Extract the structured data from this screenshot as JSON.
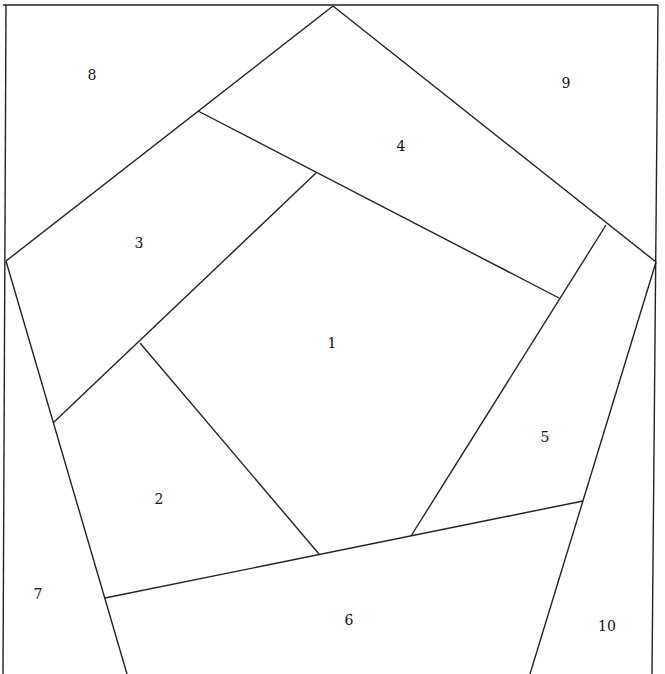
{
  "diagram": {
    "type": "pentagon-patchwork",
    "stroke_color": "#222222",
    "background": "#ffffff",
    "regions": [
      {
        "id": "8",
        "x": 92,
        "y": 75
      },
      {
        "id": "9",
        "x": 566,
        "y": 83
      },
      {
        "id": "4",
        "x": 401,
        "y": 146
      },
      {
        "id": "3",
        "x": 139,
        "y": 243
      },
      {
        "id": "1",
        "x": 332,
        "y": 343
      },
      {
        "id": "5",
        "x": 545,
        "y": 437
      },
      {
        "id": "2",
        "x": 159,
        "y": 499
      },
      {
        "id": "7",
        "x": 38,
        "y": 594
      },
      {
        "id": "6",
        "x": 349,
        "y": 620
      },
      {
        "id": "10",
        "x": 607,
        "y": 626
      }
    ],
    "lines": [
      [
        3,
        5,
        658,
        5
      ],
      [
        6,
        5,
        3,
        674
      ],
      [
        658,
        5,
        652,
        674
      ],
      [
        333,
        6,
        6,
        261
      ],
      [
        6,
        261,
        127,
        674
      ],
      [
        333,
        6,
        656,
        262
      ],
      [
        656,
        262,
        530,
        674
      ],
      [
        198,
        111,
        559,
        298
      ],
      [
        316,
        173,
        53,
        423
      ],
      [
        140,
        343,
        319,
        554
      ],
      [
        606,
        225,
        411,
        536
      ],
      [
        105,
        598,
        583,
        501
      ]
    ]
  }
}
